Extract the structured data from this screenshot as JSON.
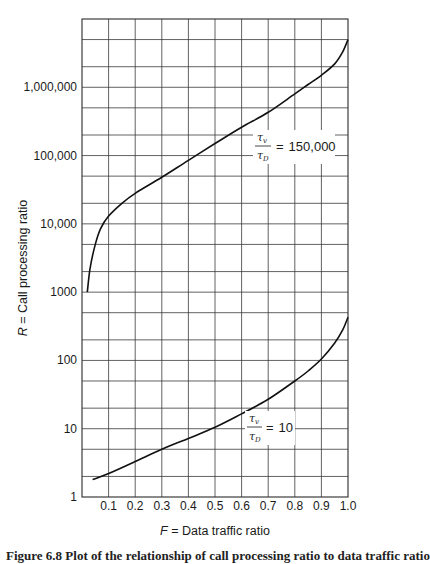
{
  "chart_data": {
    "type": "line",
    "title": "",
    "xlabel": "F = Data traffic ratio",
    "ylabel": "R = Call processing ratio",
    "xlim": [
      0,
      1.0
    ],
    "ylim": [
      1,
      10000000
    ],
    "yscale": "log",
    "grid": true,
    "x_ticks": [
      "0.1",
      "0.2",
      "0.3",
      "0.4",
      "0.5",
      "0.6",
      "0.7",
      "0.8",
      "0.9",
      "1.0"
    ],
    "y_ticks": [
      {
        "value": 1,
        "label": "1"
      },
      {
        "value": 10,
        "label": "10"
      },
      {
        "value": 100,
        "label": "100"
      },
      {
        "value": 1000,
        "label": "1000"
      },
      {
        "value": 10000,
        "label": "10,000"
      },
      {
        "value": 100000,
        "label": "100,000"
      },
      {
        "value": 1000000,
        "label": "1,000,000"
      }
    ],
    "series": [
      {
        "name": "τv/τD = 150,000",
        "ratio_label": "150,000",
        "x": [
          0.02,
          0.03,
          0.05,
          0.07,
          0.1,
          0.15,
          0.2,
          0.3,
          0.4,
          0.5,
          0.6,
          0.7,
          0.8,
          0.85,
          0.9,
          0.95,
          0.98,
          1.0
        ],
        "y": [
          1000,
          2200,
          5000,
          8500,
          13000,
          20000,
          28000,
          48000,
          85000,
          150000,
          260000,
          430000,
          800000,
          1100000,
          1500000,
          2200000,
          3300000,
          5000000
        ]
      },
      {
        "name": "τv/τD = 10",
        "ratio_label": "10",
        "x": [
          0.04,
          0.1,
          0.2,
          0.3,
          0.4,
          0.5,
          0.6,
          0.7,
          0.8,
          0.85,
          0.9,
          0.95,
          0.98,
          1.0
        ],
        "y": [
          1.8,
          2.2,
          3.3,
          5.0,
          7.2,
          10.5,
          16.5,
          27,
          50,
          70,
          105,
          180,
          280,
          430
        ]
      }
    ]
  },
  "labels": {
    "tau": "τ",
    "sub_v": "v",
    "sub_d": "D",
    "equals": "=",
    "upper_value": "150,000",
    "lower_value": "10",
    "xlabel_var": "F",
    "xlabel_text": " = Data traffic ratio",
    "ylabel_var": "R",
    "ylabel_text": " = Call processing ratio"
  },
  "caption": "Figure 6.8   Plot of the relationship of call processing ratio to data traffic ratio"
}
